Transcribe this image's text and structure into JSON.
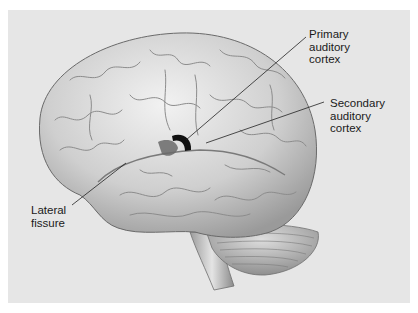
{
  "figure": {
    "background_color": "#e6e6e6",
    "brain_color": "#d4d4d4",
    "highlight_primary_color": "#111111",
    "highlight_secondary_color": "#6a6a6a"
  },
  "labels": {
    "primary": {
      "lines": [
        "Primary",
        "auditory",
        "cortex"
      ]
    },
    "secondary": {
      "lines": [
        "Secondary",
        "auditory",
        "cortex"
      ]
    },
    "lateral": {
      "lines": [
        "Lateral",
        "fissure"
      ]
    }
  }
}
